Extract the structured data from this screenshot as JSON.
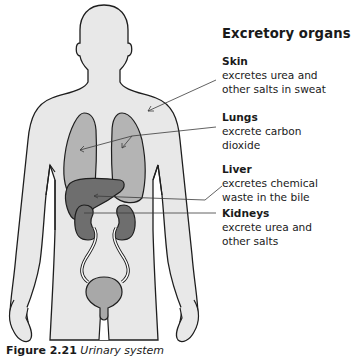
{
  "title": "Excretory organs",
  "labels": [
    {
      "name": "Skin",
      "desc": [
        "excretes urea and",
        "other salts in sweat"
      ]
    },
    {
      "name": "Lungs",
      "desc": [
        "excrete carbon",
        "dioxide"
      ]
    },
    {
      "name": "Liver",
      "desc": [
        "excretes chemical",
        "waste in the bile"
      ]
    },
    {
      "name": "Kidneys",
      "desc": [
        "excrete urea and",
        "other salts"
      ]
    }
  ],
  "caption": {
    "figure": "Figure 2.21",
    "title": "Urinary system"
  },
  "colors": {
    "body_fill": "#e8e8e8",
    "outline": "#1e1e1e",
    "lungs": "#b4b4b4",
    "liver": "#6e6e6e",
    "kidneys": "#6e6e6e",
    "bladder": "#a8a8a8",
    "leader_line": "#3a3a3a"
  }
}
